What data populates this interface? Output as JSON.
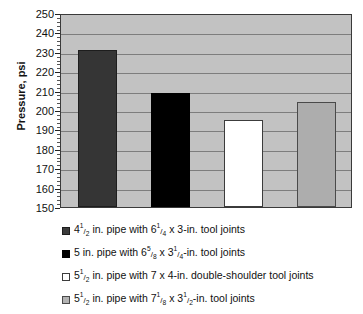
{
  "chart_data": {
    "type": "bar",
    "title": "",
    "xlabel": "",
    "ylabel": "Pressure, psi",
    "ylim": [
      150,
      250
    ],
    "ytick_step": 10,
    "yticks": [
      250,
      240,
      230,
      220,
      210,
      200,
      190,
      180,
      170,
      160,
      150
    ],
    "grid": true,
    "legend_position": "bottom",
    "categories": [
      "4 1/2 in. pipe with 6 1/4 x 3-in. tool joints",
      "5 in. pipe with 6 5/8 x 3 1/4-in. tool joints",
      "5 1/2 in. pipe with 7 x 4-in. double-shoulder tool joints",
      "5 1/2 in. pipe with 7 1/8 x 3 1/2-in. tool joints"
    ],
    "values": [
      231,
      209,
      195,
      204
    ],
    "colors": [
      "#353535",
      "#000000",
      "#ffffff",
      "#adadad"
    ],
    "plot_background": "#c2c2c2",
    "gridline_color": "#7d7d7d"
  },
  "axis": {
    "y_title": "Pressure, psi",
    "tick_labels": [
      "250",
      "240",
      "230",
      "220",
      "210",
      "200",
      "190",
      "180",
      "170",
      "160",
      "150"
    ]
  },
  "legend": {
    "items": [
      {
        "swatch": "dark-gray-swatch",
        "pre": "4",
        "num": "1",
        "den": "2",
        "mid": " in. pipe with 6",
        "num2": "1",
        "den2": "4",
        "post": " x 3-in. tool joints",
        "plain": "4 1/2 in. pipe with 6 1/4 x 3-in. tool joints"
      },
      {
        "swatch": "black-swatch",
        "pre": "5 in. pipe with 6",
        "num": "5",
        "den": "8",
        "mid": " x 3",
        "num2": "1",
        "den2": "4",
        "post": "-in. tool joints",
        "plain": "5 in. pipe with 6 5/8 x 3 1/4-in. tool joints"
      },
      {
        "swatch": "white-swatch",
        "pre": "5",
        "num": "1",
        "den": "2",
        "mid": " in. pipe with 7 x 4-in. double-shoulder tool joints",
        "num2": "",
        "den2": "",
        "post": "",
        "plain": "5 1/2 in. pipe with 7 x 4-in. double-shoulder tool joints"
      },
      {
        "swatch": "light-gray-swatch",
        "pre": "5",
        "num": "1",
        "den": "2",
        "mid": " in. pipe with 7",
        "num2": "1",
        "den2": "8",
        "mid2": " x 3",
        "num3": "1",
        "den3": "2",
        "post": "-in. tool joints",
        "plain": "5 1/2 in. pipe with 7 1/8 x 3 1/2-in. tool joints"
      }
    ]
  }
}
